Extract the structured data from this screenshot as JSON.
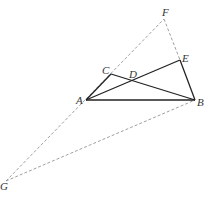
{
  "diagram": {
    "points": {
      "A": {
        "label": "A",
        "x": 86,
        "y": 100,
        "lx": 76,
        "ly": 104
      },
      "B": {
        "label": "B",
        "x": 195,
        "y": 100,
        "lx": 197,
        "ly": 106
      },
      "C": {
        "label": "C",
        "x": 111,
        "y": 74,
        "lx": 102,
        "ly": 74
      },
      "D": {
        "label": "D",
        "x": 133,
        "y": 80,
        "lx": 129,
        "ly": 78
      },
      "E": {
        "label": "E",
        "x": 180,
        "y": 60,
        "lx": 182,
        "ly": 62
      },
      "F": {
        "label": "F",
        "x": 164,
        "y": 19,
        "lx": 162,
        "ly": 16
      },
      "G": {
        "label": "G",
        "x": 6,
        "y": 181,
        "lx": 0,
        "ly": 190
      }
    },
    "solid_segments": [
      [
        "A",
        "B"
      ],
      [
        "A",
        "C"
      ],
      [
        "C",
        "B"
      ],
      [
        "A",
        "E"
      ],
      [
        "E",
        "B"
      ]
    ],
    "dashed_segments": [
      [
        "G",
        "F"
      ],
      [
        "F",
        "E"
      ],
      [
        "G",
        "B"
      ]
    ],
    "colors": {
      "solid": "#222222",
      "dashed": "#888888"
    }
  }
}
